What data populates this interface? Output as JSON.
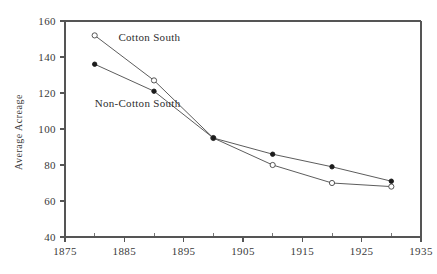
{
  "chart_data": {
    "type": "line",
    "title": "",
    "subtitle": "",
    "xlabel": "",
    "ylabel": "Average Acreage",
    "x": [
      1880,
      1890,
      1900,
      1910,
      1920,
      1930
    ],
    "xlim": [
      1875,
      1935
    ],
    "ylim": [
      40,
      160
    ],
    "xticks": [
      1875,
      1885,
      1895,
      1905,
      1915,
      1925,
      1935
    ],
    "xtick_labels": [
      "1875",
      "1885",
      "1895",
      "1905",
      "1915",
      "1925",
      "1935"
    ],
    "x_minor_ticks": [
      1880,
      1890,
      1900,
      1910,
      1920,
      1930
    ],
    "yticks": [
      40,
      60,
      80,
      100,
      120,
      140,
      160
    ],
    "ytick_labels": [
      "40",
      "60",
      "80",
      "100",
      "120",
      "140",
      "160"
    ],
    "grid": false,
    "legend_position": "inline-annotation",
    "series": [
      {
        "name": "Cotton South",
        "marker": "open-circle",
        "values": [
          152,
          127,
          95,
          80,
          70,
          68
        ]
      },
      {
        "name": "Non-Cotton South",
        "marker": "filled-circle",
        "values": [
          136,
          121,
          95,
          86,
          79,
          71
        ]
      }
    ],
    "annotations": [
      {
        "text": "Cotton South",
        "x": 1884,
        "y": 149
      },
      {
        "text": "Non-Cotton South",
        "x": 1880,
        "y": 112
      }
    ],
    "colors": {
      "axis": "#555555",
      "line": "#4a4a4a",
      "marker_open_fill": "#ffffff",
      "marker_filled": "#1c1c1c",
      "text": "#3a3a3a",
      "background": "#ffffff"
    }
  },
  "axes": {
    "y_title": "Average Acreage"
  },
  "labels": {
    "cotton_south": "Cotton South",
    "non_cotton_south": "Non-Cotton South"
  }
}
